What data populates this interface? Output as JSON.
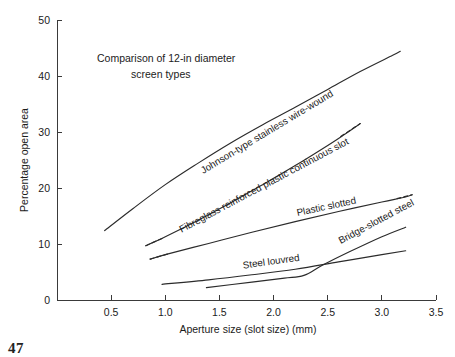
{
  "page": {
    "footer_number": "47"
  },
  "chart_data": {
    "type": "line",
    "title": "Comparison of 12-in diameter screen types",
    "title_lines": [
      "Comparison of 12-in diameter",
      "screen types"
    ],
    "xlabel": "Aperture size (slot size) (mm)",
    "ylabel": "Percentage open area",
    "xlim": [
      0,
      3.5
    ],
    "ylim": [
      0,
      50
    ],
    "xticks": [
      0.5,
      1.0,
      1.5,
      2.0,
      2.5,
      3.0,
      3.5
    ],
    "xtick_labels": [
      "0.5",
      "1.0",
      "1.5",
      "2.0",
      "2.5",
      "3.0",
      "3.5"
    ],
    "yticks": [
      0,
      10,
      20,
      30,
      40,
      50
    ],
    "ytick_labels": [
      "0",
      "10",
      "20",
      "30",
      "40",
      "50"
    ],
    "grid": false,
    "legend": "inline-curve-labels",
    "line_color": "#2b2b2b",
    "series": [
      {
        "name": "Johnson-type stainless wire-wound",
        "label": "Johnson-type stainless wire-wound",
        "style": "solid",
        "x": [
          0.44,
          0.7,
          1.0,
          1.3,
          1.6,
          1.9,
          2.2,
          2.5,
          2.8,
          3.1,
          3.17
        ],
        "values": [
          12.4,
          16.3,
          20.6,
          24.4,
          28.0,
          31.3,
          34.4,
          37.6,
          40.8,
          43.7,
          44.4
        ]
      },
      {
        "name": "Fibreglass reinforced plastic continuous slot",
        "label": "Fibreglass reinforced plastic continuous slot",
        "style": "solid-with-dashed-ends",
        "x": [
          0.82,
          1.0,
          1.3,
          1.6,
          1.9,
          2.2,
          2.5,
          2.65,
          2.8
        ],
        "values": [
          9.7,
          11.3,
          14.2,
          17.3,
          20.6,
          24.0,
          27.6,
          29.5,
          31.5
        ],
        "dashed_segments": [
          [
            0.82,
            9.7
          ],
          [
            0.97,
            11.0
          ],
          [
            2.62,
            29.2
          ],
          [
            2.8,
            31.5
          ]
        ]
      },
      {
        "name": "Plastic slotted",
        "label": "Plastic slotted",
        "style": "solid-with-dashed-ends",
        "x": [
          0.86,
          1.0,
          1.4,
          1.8,
          2.2,
          2.6,
          3.0,
          3.2,
          3.28
        ],
        "values": [
          7.3,
          8.1,
          10.1,
          12.1,
          14.0,
          15.8,
          17.5,
          18.3,
          18.8
        ],
        "dashed_segments": [
          [
            0.86,
            7.3
          ],
          [
            1.02,
            8.2
          ],
          [
            3.14,
            18.1
          ],
          [
            3.28,
            18.8
          ]
        ]
      },
      {
        "name": "Steel louvred",
        "label": "Steel louvred",
        "style": "solid",
        "x": [
          0.97,
          1.4,
          1.8,
          2.2,
          2.6,
          3.0,
          3.22
        ],
        "values": [
          2.8,
          3.6,
          4.5,
          5.5,
          6.8,
          8.1,
          8.8
        ]
      },
      {
        "name": "Bridge-slotted steel",
        "label": "Bridge-slotted steel",
        "style": "solid",
        "x": [
          1.38,
          1.8,
          2.1,
          2.28,
          2.45,
          2.7,
          3.0,
          3.22
        ],
        "values": [
          2.2,
          3.2,
          3.9,
          4.4,
          6.2,
          8.6,
          11.3,
          13.0
        ]
      }
    ],
    "series_label_positions": [
      {
        "name": "Johnson-type stainless wire-wound",
        "x_mm": 1.35,
        "y_pct": 22.5,
        "rotation": -31
      },
      {
        "name": "Fibreglass reinforced plastic continuous slot",
        "x_mm": 1.15,
        "y_pct": 12.0,
        "rotation": -28
      },
      {
        "name": "Plastic slotted",
        "x_mm": 2.22,
        "y_pct": 15.0,
        "rotation": -12
      },
      {
        "name": "Steel louvred",
        "x_mm": 1.72,
        "y_pct": 5.6,
        "rotation": -8
      },
      {
        "name": "Bridge-slotted steel",
        "x_mm": 2.62,
        "y_pct": 10.0,
        "rotation": -28
      }
    ]
  }
}
